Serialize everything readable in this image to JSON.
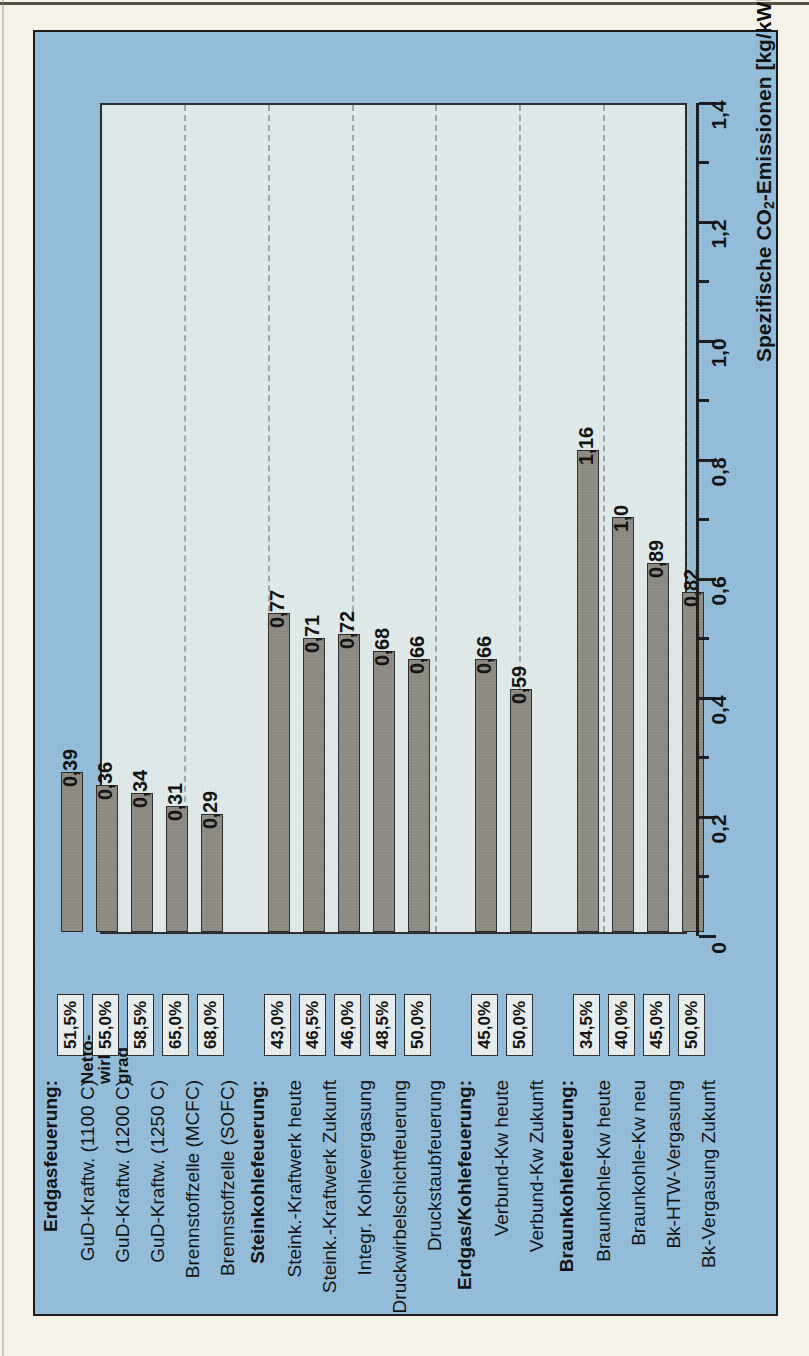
{
  "figure": {
    "panel_bg": "#93bcd9",
    "plot_bg": "#dfe9e9",
    "bar_fill": "#8d8a82",
    "ink": "#1c1c1c"
  },
  "axis": {
    "title_prefix": "Spezifische CO",
    "title_sub": "2",
    "title_suffix": "-Emissionen [kg/kWh",
    "title_sub2": "el",
    "title_end": "]",
    "title_full": "Spezifische CO2-Emissionen [kg/kWhel]",
    "ticks": [
      "0",
      "0,2",
      "0,4",
      "0,6",
      "0,8",
      "1,0",
      "1,2",
      "1,4"
    ],
    "min": 0,
    "max": 1.4,
    "minor_step": 0.1
  },
  "efficiency_header": "Netto-\nwirkungs-\ngrad",
  "chart_data": {
    "type": "bar",
    "title": "",
    "xlabel": "",
    "ylabel": "Spezifische CO2-Emissionen [kg/kWhel]",
    "ylim": [
      0,
      1.4
    ],
    "grid": true,
    "orientation": "horizontal-rotated",
    "legend": "none",
    "groups": [
      {
        "name": "Erdgasfeuerung:",
        "items": [
          {
            "label": "GuD-Kraftw. (1100 C)",
            "value": 0.39,
            "value_label": "0,39",
            "efficiency": "51,5%"
          },
          {
            "label": "GuD-Kraftw. (1200 C)",
            "value": 0.36,
            "value_label": "0,36",
            "efficiency": "55,0%"
          },
          {
            "label": "GuD-Kraftw. (1250 C)",
            "value": 0.34,
            "value_label": "0,34",
            "efficiency": "58,5%"
          },
          {
            "label": "Brennstoffzelle (MCFC)",
            "value": 0.31,
            "value_label": "0,31",
            "efficiency": "65,0%"
          },
          {
            "label": "Brennstoffzelle (SOFC)",
            "value": 0.29,
            "value_label": "0,29",
            "efficiency": "68,0%"
          }
        ]
      },
      {
        "name": "Steinkohlefeuerung:",
        "items": [
          {
            "label": "Steink.-Kraftwerk heute",
            "value": 0.77,
            "value_label": "0,77",
            "efficiency": "43,0%"
          },
          {
            "label": "Steink.-Kraftwerk Zukunft",
            "value": 0.71,
            "value_label": "0,71",
            "efficiency": "46,5%"
          },
          {
            "label": "Integr. Kohlevergasung",
            "value": 0.72,
            "value_label": "0,72",
            "efficiency": "46,0%"
          },
          {
            "label": "Druckwirbelschichtfeuerung",
            "value": 0.68,
            "value_label": "0,68",
            "efficiency": "48,5%"
          },
          {
            "label": "Druckstaubfeuerung",
            "value": 0.66,
            "value_label": "0,66",
            "efficiency": "50,0%"
          }
        ]
      },
      {
        "name": "Erdgas/Kohlefeuerung:",
        "items": [
          {
            "label": "Verbund-Kw heute",
            "value": 0.66,
            "value_label": "0,66",
            "efficiency": "45,0%"
          },
          {
            "label": "Verbund-Kw Zukunft",
            "value": 0.59,
            "value_label": "0,59",
            "efficiency": "50,0%"
          }
        ]
      },
      {
        "name": "Braunkohlefeuerung:",
        "items": [
          {
            "label": "Braunkohle-Kw heute",
            "value": 1.16,
            "value_label": "1,16",
            "efficiency": "34,5%"
          },
          {
            "label": "Braunkohle-Kw neu",
            "value": 1.0,
            "value_label": "1,0",
            "efficiency": "40,0%"
          },
          {
            "label": "Bk-HTW-Vergasung",
            "value": 0.89,
            "value_label": "0,89",
            "efficiency": "45,0%"
          },
          {
            "label": "Bk-Vergasung Zukunft",
            "value": 0.82,
            "value_label": "0,82",
            "efficiency": "50,0%"
          }
        ]
      }
    ]
  }
}
